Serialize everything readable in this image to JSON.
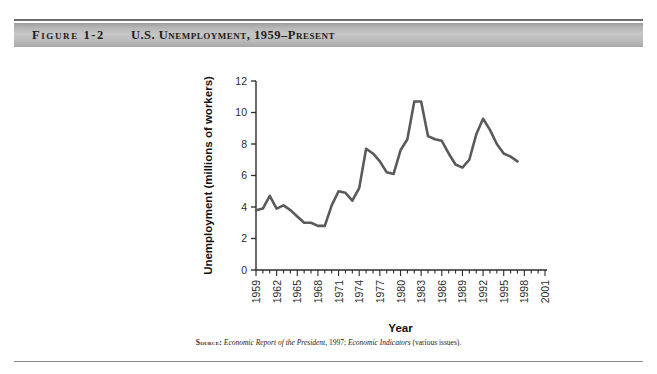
{
  "figure": {
    "number": "Figure 1-2",
    "title": "U.S. Unemployment, 1959–Present",
    "source_label": "Source:",
    "source_text_1": "Economic Report of the President,",
    "source_text_2": " 1997; ",
    "source_text_3": "Economic Indicators",
    "source_text_4": " (various issues)."
  },
  "colors": {
    "line": "#5a5a5a",
    "axis": "#2b2b2b",
    "header_bar": "#bdbdbd",
    "rule": "#6d6d6d",
    "background": "#ffffff"
  },
  "chart_data": {
    "type": "line",
    "title": "U.S. Unemployment, 1959–Present",
    "xlabel": "Year",
    "ylabel": "Unemployment (millions of workers)",
    "xlim": [
      1959,
      2001
    ],
    "ylim": [
      0,
      12
    ],
    "yticks": [
      0,
      2,
      4,
      6,
      8,
      10,
      12
    ],
    "ytick_labels": [
      "0",
      "2",
      "4",
      "6",
      "8",
      "10",
      "12"
    ],
    "xticks": [
      1959,
      1962,
      1965,
      1968,
      1971,
      1974,
      1977,
      1980,
      1983,
      1986,
      1989,
      1992,
      1995,
      1998,
      2001
    ],
    "xtick_labels": [
      "1959",
      "1962",
      "1965",
      "1968",
      "1971",
      "1974",
      "1977",
      "1980",
      "1983",
      "1986",
      "1989",
      "1992",
      "1995",
      "1998",
      "2001"
    ],
    "minor_xtick_interval": 1,
    "grid": false,
    "legend": "none",
    "series": [
      {
        "name": "Unemployment (millions of workers)",
        "x": [
          1959,
          1960,
          1961,
          1962,
          1963,
          1964,
          1965,
          1966,
          1967,
          1968,
          1969,
          1970,
          1971,
          1972,
          1973,
          1974,
          1975,
          1976,
          1977,
          1978,
          1979,
          1980,
          1981,
          1982,
          1983,
          1984,
          1985,
          1986,
          1987,
          1988,
          1989,
          1990,
          1991,
          1992,
          1993,
          1994,
          1995,
          1996,
          1997
        ],
        "values": [
          3.8,
          3.9,
          4.7,
          3.9,
          4.1,
          3.8,
          3.4,
          3.0,
          3.0,
          2.8,
          2.8,
          4.1,
          5.0,
          4.9,
          4.4,
          5.2,
          7.7,
          7.4,
          6.9,
          6.2,
          6.1,
          7.6,
          8.3,
          10.7,
          10.7,
          8.5,
          8.3,
          8.2,
          7.4,
          6.7,
          6.5,
          7.0,
          8.6,
          9.6,
          8.9,
          8.0,
          7.4,
          7.2,
          6.9
        ]
      }
    ]
  }
}
